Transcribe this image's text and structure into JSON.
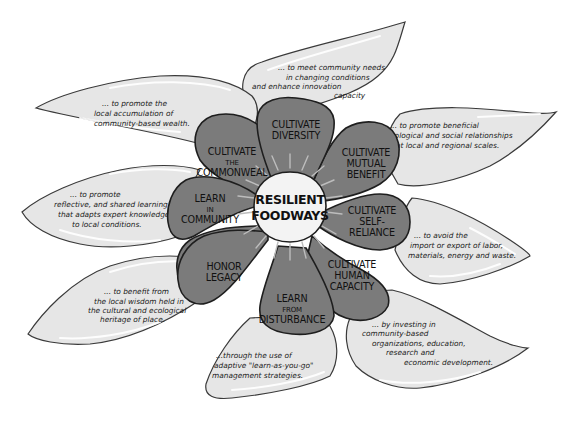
{
  "diagram": {
    "title": "Resilient Foodways",
    "center": {
      "line1": "RESILIENT",
      "line2": "FOODWAYS"
    },
    "colors": {
      "background": "#ffffff",
      "leaf_fill": "#e6e6e6",
      "petal_fill": "#7b7b7b",
      "center_fill": "#f3f3f3",
      "outline": "#1e1e1e"
    },
    "petals": [
      {
        "id": "diversity",
        "lines": [
          "CULTIVATE",
          "DIVERSITY"
        ]
      },
      {
        "id": "mutual-benefit",
        "lines": [
          "CULTIVATE",
          "MUTUAL",
          "BENEFIT"
        ]
      },
      {
        "id": "self-reliance",
        "lines": [
          "CULTIVATE",
          "SELF-",
          "RELIANCE"
        ]
      },
      {
        "id": "human-capacity",
        "lines": [
          "CULTIVATE",
          "HUMAN",
          "CAPACITY"
        ]
      },
      {
        "id": "disturbance",
        "lines": [
          "LEARN",
          "FROM",
          "DISTURBANCE"
        ]
      },
      {
        "id": "legacy",
        "lines": [
          "HONOR",
          "LEGACY"
        ]
      },
      {
        "id": "community",
        "lines": [
          "LEARN",
          "IN",
          "COMMUNITY"
        ]
      },
      {
        "id": "commonweal",
        "lines": [
          "CULTIVATE",
          "THE",
          "COMMONWEAL"
        ]
      }
    ],
    "leaves": [
      {
        "id": "diversity",
        "lines": [
          "... to meet community needs",
          "in changing conditions",
          "and enhance innovation",
          "capacity"
        ]
      },
      {
        "id": "mutual-benefit",
        "lines": [
          "... to promote beneficial",
          "ecological and social relationships",
          "at local and regional scales."
        ]
      },
      {
        "id": "self-reliance",
        "lines": [
          "... to avoid the",
          "import or export of labor,",
          "materials, energy and waste."
        ]
      },
      {
        "id": "human-capacity",
        "lines": [
          "... by investing in",
          "community-based",
          "organizations, education,",
          "research and",
          "economic development."
        ]
      },
      {
        "id": "disturbance",
        "lines": [
          "...through the use of",
          "adaptive \"learn-as-you-go\"",
          "management strategies."
        ]
      },
      {
        "id": "legacy",
        "lines": [
          "... to benefit from",
          "the local wisdom held in",
          "the cultural and ecological",
          "heritage of place."
        ]
      },
      {
        "id": "community",
        "lines": [
          "... to promote",
          "reflective, and shared learning",
          "that adapts expert knowledge",
          "to local conditions."
        ]
      },
      {
        "id": "commonweal",
        "lines": [
          "... to promote the",
          "local accumulation of",
          "community-based wealth."
        ]
      }
    ]
  }
}
